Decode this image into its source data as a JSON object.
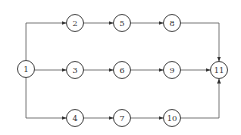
{
  "diagram": {
    "type": "network-graph",
    "nodes": [
      {
        "id": "1",
        "label": "1",
        "x": 26,
        "y": 69
      },
      {
        "id": "2",
        "label": "2",
        "x": 75,
        "y": 23
      },
      {
        "id": "5",
        "label": "5",
        "x": 122,
        "y": 23
      },
      {
        "id": "8",
        "label": "8",
        "x": 172,
        "y": 23
      },
      {
        "id": "3",
        "label": "3",
        "x": 75,
        "y": 70
      },
      {
        "id": "6",
        "label": "6",
        "x": 122,
        "y": 70
      },
      {
        "id": "9",
        "label": "9",
        "x": 172,
        "y": 70
      },
      {
        "id": "11",
        "label": "11",
        "x": 219,
        "y": 70
      },
      {
        "id": "4",
        "label": "4",
        "x": 75,
        "y": 118
      },
      {
        "id": "7",
        "label": "7",
        "x": 122,
        "y": 118
      },
      {
        "id": "10",
        "label": "10",
        "x": 172,
        "y": 118
      }
    ],
    "edges": [
      {
        "from": "1",
        "to": "2"
      },
      {
        "from": "1",
        "to": "3"
      },
      {
        "from": "1",
        "to": "4"
      },
      {
        "from": "2",
        "to": "5"
      },
      {
        "from": "5",
        "to": "8"
      },
      {
        "from": "8",
        "to": "11"
      },
      {
        "from": "3",
        "to": "6"
      },
      {
        "from": "6",
        "to": "9"
      },
      {
        "from": "9",
        "to": "11"
      },
      {
        "from": "4",
        "to": "7"
      },
      {
        "from": "7",
        "to": "10"
      },
      {
        "from": "10",
        "to": "11"
      }
    ],
    "colors": {
      "stroke": "#333333",
      "edge": "#555555",
      "background": "#ffffff"
    }
  }
}
